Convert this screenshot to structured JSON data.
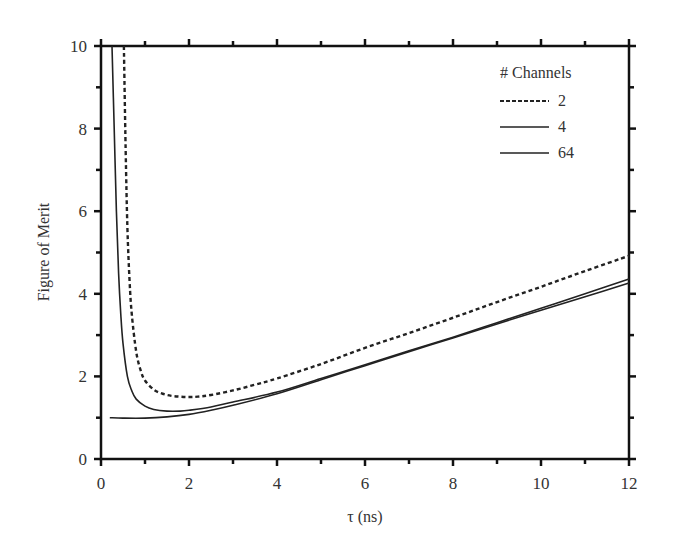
{
  "chart_data": {
    "type": "line",
    "title": "",
    "xlabel": "τ (ns)",
    "ylabel": "Figure of Merit",
    "xlim": [
      0,
      12
    ],
    "ylim": [
      0,
      10
    ],
    "xticks": [
      0,
      2,
      4,
      6,
      8,
      10,
      12
    ],
    "yticks": [
      0,
      2,
      4,
      6,
      8,
      10
    ],
    "minor_xticks": [
      1,
      3,
      5,
      7,
      9,
      11
    ],
    "minor_yticks": [
      1,
      3,
      5,
      7,
      9
    ],
    "grid": false,
    "legend": {
      "title": "# Channels",
      "position": "upper right"
    },
    "series": [
      {
        "name": "2",
        "style": "dashed",
        "x": [
          0.52,
          0.56,
          0.6,
          0.65,
          0.7,
          0.8,
          0.9,
          1.0,
          1.2,
          1.4,
          1.6,
          1.8,
          2.0,
          2.2,
          2.5,
          3.0,
          3.5,
          4.0,
          5.0,
          6.0,
          7.0,
          8.0,
          9.0,
          10.0,
          11.0,
          12.0
        ],
        "y": [
          10.0,
          7.5,
          5.6,
          4.3,
          3.5,
          2.6,
          2.15,
          1.9,
          1.68,
          1.58,
          1.53,
          1.51,
          1.5,
          1.51,
          1.55,
          1.66,
          1.8,
          1.95,
          2.3,
          2.69,
          3.05,
          3.42,
          3.8,
          4.17,
          4.55,
          4.92
        ]
      },
      {
        "name": "4",
        "style": "solid",
        "x": [
          0.25,
          0.3,
          0.35,
          0.4,
          0.45,
          0.5,
          0.6,
          0.7,
          0.8,
          1.0,
          1.2,
          1.5,
          1.8,
          2.0,
          2.5,
          3.0,
          4.0,
          5.0,
          6.0,
          7.0,
          8.0,
          9.0,
          10.0,
          11.0,
          12.0
        ],
        "y": [
          10.0,
          8.0,
          6.0,
          4.5,
          3.5,
          2.8,
          2.0,
          1.65,
          1.45,
          1.28,
          1.2,
          1.16,
          1.16,
          1.18,
          1.26,
          1.38,
          1.62,
          1.95,
          2.28,
          2.62,
          2.95,
          3.3,
          3.65,
          4.0,
          4.36
        ]
      },
      {
        "name": "64",
        "style": "solid",
        "x": [
          0.2,
          0.5,
          1.0,
          1.5,
          2.0,
          2.5,
          3.0,
          4.0,
          5.0,
          6.0,
          7.0,
          8.0,
          9.0,
          10.0,
          11.0,
          12.0
        ],
        "y": [
          1.0,
          0.99,
          0.99,
          1.02,
          1.08,
          1.18,
          1.3,
          1.58,
          1.92,
          2.26,
          2.6,
          2.93,
          3.27,
          3.6,
          3.93,
          4.26
        ]
      }
    ]
  },
  "plot_area": {
    "left": 101,
    "right": 629,
    "top": 46,
    "bottom": 459
  }
}
